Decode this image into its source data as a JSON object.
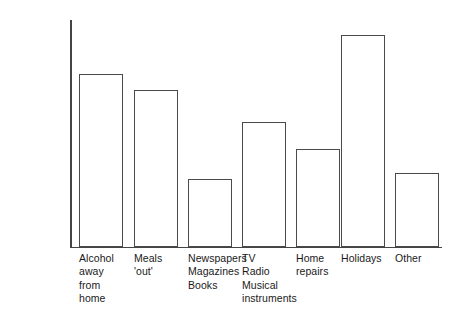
{
  "chart_data": {
    "type": "bar",
    "title": "",
    "xlabel": "",
    "ylabel": "Average weekly expenditure",
    "categories": [
      "Alcohol\naway\nfrom\nhome",
      "Meals\n'out'",
      "Newspapers\nMagazines\nBooks",
      "TV\nRadio\nMusical\ninstruments",
      "Home\nrepairs",
      "Holidays",
      "Other"
    ],
    "values": [
      10.5,
      9.5,
      4.15,
      7.55,
      5.95,
      12.85,
      4.5
    ],
    "ylim": [
      0,
      13.8
    ],
    "yticks": [
      2,
      4,
      6,
      8,
      10,
      12
    ],
    "ytick_labels": [
      "£2",
      "£4",
      "£6",
      "£8",
      "£10",
      "£12"
    ],
    "currency_symbol": "£",
    "grid": false,
    "legend": false,
    "bar_fill_color": "#ffffff",
    "bar_edge_color": "#4a4a4a",
    "axis_color": "#444444",
    "background_color": "#ffffff"
  },
  "axis": {
    "y_title": "Average weekly expenditure"
  },
  "bars": [
    {
      "label": "Alcohol\naway\nfrom\nhome",
      "value": 10.5,
      "name": "bar-alcohol-away-from-home"
    },
    {
      "label": "Meals\n'out'",
      "value": 9.5,
      "name": "bar-meals-out"
    },
    {
      "label": "Newspapers\nMagazines\nBooks",
      "value": 4.15,
      "name": "bar-newspapers-magazines-books"
    },
    {
      "label": "TV\nRadio\nMusical\ninstruments",
      "value": 7.55,
      "name": "bar-tv-radio-musical-instruments"
    },
    {
      "label": "Home\nrepairs",
      "value": 5.95,
      "name": "bar-home-repairs"
    },
    {
      "label": "Holidays",
      "value": 12.85,
      "name": "bar-holidays"
    },
    {
      "label": "Other",
      "value": 4.5,
      "name": "bar-other"
    }
  ]
}
